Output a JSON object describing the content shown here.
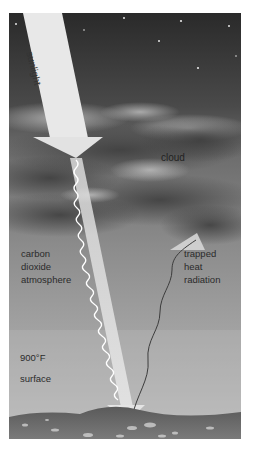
{
  "diagram": {
    "type": "illustration",
    "labels": {
      "sunlight": "sunlight",
      "cloud": "cloud",
      "atmosphere": [
        "carbon",
        "dioxide",
        "atmosphere"
      ],
      "trapped": [
        "trapped",
        "heat",
        "radiation"
      ],
      "temperature": "900°F",
      "surface": "surface"
    },
    "elements": [
      {
        "id": "sunlight-arrow",
        "kind": "arrow",
        "from": "space",
        "to": "cloud-layer"
      },
      {
        "id": "light-beam",
        "kind": "wavy-beam",
        "from": "cloud-layer",
        "to": "surface"
      },
      {
        "id": "heat-radiation",
        "kind": "wavy-line-arrow",
        "from": "surface",
        "to": "cloud-layer"
      }
    ],
    "colors": {
      "sky_top": "#2e2e2e",
      "sky_mid": "#6e6e6e",
      "atmosphere": "#9a9a9a",
      "haze_bottom": "#b8b8b8",
      "arrow_fill": "#e8e8e8",
      "ground": "#6a6a6a",
      "heat_line": "#3c3c3c"
    }
  }
}
